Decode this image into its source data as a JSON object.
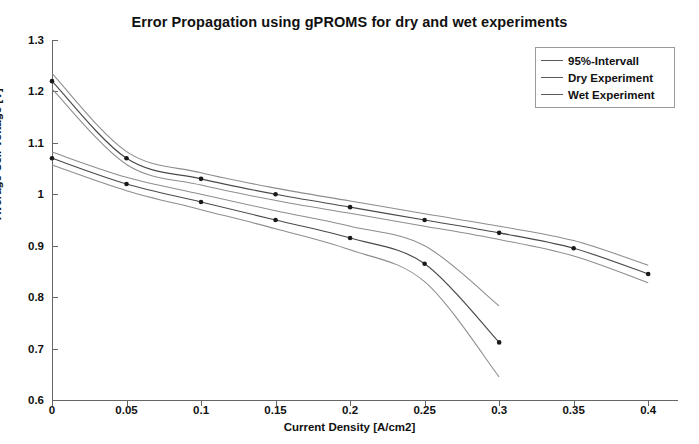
{
  "chart_data": {
    "type": "line",
    "title": "Error Propagation using gPROMS for dry and wet experiments",
    "xlabel": "Current Density [A/cm2]",
    "ylabel": "Average Cell Voltage [V]",
    "xlim": [
      0,
      0.42
    ],
    "ylim": [
      0.6,
      1.3
    ],
    "xticks": [
      0,
      0.05,
      0.1,
      0.15,
      0.2,
      0.25,
      0.3,
      0.35,
      0.4
    ],
    "xticklabels": [
      "0",
      "0.05",
      "0.1",
      "0.15",
      "0.2",
      "0.25",
      "0.3",
      "0.35",
      "0.4"
    ],
    "yticks": [
      0.6,
      0.7,
      0.8,
      0.9,
      1.0,
      1.1,
      1.2,
      1.3
    ],
    "yticklabels": [
      "0.6",
      "0.7",
      "0.8",
      "0.9",
      "1",
      "1.1",
      "1.2",
      "1.3"
    ],
    "grid": false,
    "legend_position": "upper right",
    "legend_entries": [
      "95%-Intervall",
      "Dry Experiment",
      "Wet Experiment"
    ],
    "series": [
      {
        "name": "Dry Experiment",
        "x": [
          0,
          0.05,
          0.1,
          0.15,
          0.2,
          0.25,
          0.3,
          0.35,
          0.4
        ],
        "values": [
          1.22,
          1.07,
          1.03,
          1.0,
          0.975,
          0.95,
          0.925,
          0.895,
          0.845
        ],
        "markers": true,
        "interval_upper": [
          1.235,
          1.083,
          1.042,
          1.012,
          0.987,
          0.962,
          0.938,
          0.91,
          0.862
        ],
        "interval_lower": [
          1.205,
          1.058,
          1.018,
          0.988,
          0.963,
          0.938,
          0.912,
          0.88,
          0.828
        ]
      },
      {
        "name": "Wet Experiment",
        "x": [
          0,
          0.05,
          0.1,
          0.15,
          0.2,
          0.25,
          0.3
        ],
        "values": [
          1.07,
          1.02,
          0.985,
          0.95,
          0.915,
          0.865,
          0.712
        ],
        "markers": true,
        "interval_upper": [
          1.082,
          1.033,
          1.0,
          0.968,
          0.938,
          0.9,
          0.783
        ],
        "interval_lower": [
          1.057,
          1.007,
          0.97,
          0.933,
          0.892,
          0.83,
          0.645
        ]
      }
    ]
  },
  "chart": {
    "title": "Error Propagation using gPROMS for dry and wet experiments",
    "x_axis_title": "Current Density [A/cm2]",
    "y_axis_title": "Average Cell Voltage [V]",
    "x_tick_labels": [
      "0",
      "0.05",
      "0.1",
      "0.15",
      "0.2",
      "0.25",
      "0.3",
      "0.35",
      "0.4"
    ],
    "y_tick_labels": [
      "0.6",
      "0.7",
      "0.8",
      "0.9",
      "1",
      "1.1",
      "1.2",
      "1.3"
    ]
  },
  "legend": {
    "items": [
      {
        "label": "95%-Intervall",
        "color": "#8d8d8d"
      },
      {
        "label": "Dry Experiment",
        "color": "#4a4a4a"
      },
      {
        "label": "Wet Experiment",
        "color": "#4a4a4a"
      }
    ]
  },
  "colors": {
    "interval_line": "#8d8d8d",
    "main_line": "#4a4a4a",
    "marker": "#1a1a1a",
    "axis": "#666666",
    "text": "#111111",
    "background": "#ffffff"
  }
}
